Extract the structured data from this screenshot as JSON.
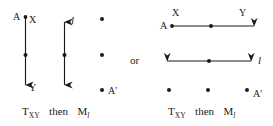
{
  "figure": {
    "background_color": "#ffffff",
    "ink_color": "#1a1a1a",
    "left_panel": {
      "labels": {
        "point_a": "A",
        "vector_tail": "X",
        "vector_head": "Y",
        "line": "l",
        "image_point": "A'"
      },
      "caption": {
        "transform_1": "T",
        "transform_1_sub": "XY",
        "connector": "then",
        "transform_2": "M",
        "transform_2_sub": "l"
      },
      "translation_arrow": {
        "orientation": "vertical-down",
        "heads": "single",
        "has_midpoint_dot": true
      },
      "mirror_line_arrow": {
        "orientation": "vertical",
        "heads": "double",
        "has_midpoint_dot": true
      },
      "result_column_dots": 3
    },
    "connector_word": "or",
    "right_panel": {
      "labels": {
        "point_a": "A",
        "vector_tail": "X",
        "vector_head": "Y",
        "line": "l",
        "image_point": "A'"
      },
      "caption": {
        "transform_1": "T",
        "transform_1_sub": "XY",
        "connector": "then",
        "transform_2": "M",
        "transform_2_sub": "l"
      },
      "translation_arrow": {
        "orientation": "horizontal-right",
        "heads": "single",
        "has_midpoint_dot": true
      },
      "mirror_line_arrow": {
        "orientation": "horizontal",
        "heads": "double",
        "has_midpoint_dot": true
      },
      "result_row_dots": 3
    }
  }
}
